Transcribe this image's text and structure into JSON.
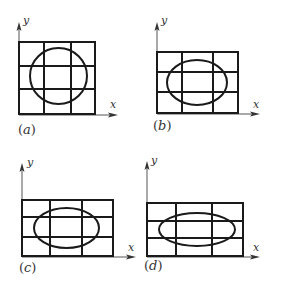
{
  "colors": {
    "ink": "#1a1a1a",
    "axis": "#555555",
    "background": "#ffffff"
  },
  "panels": [
    {
      "id": "a",
      "label": "(a)",
      "label_letter": "a",
      "axis_x_label": "x",
      "axis_y_label": "y",
      "shape": "circle",
      "grid": {
        "left": 19,
        "top": 42,
        "right": 95,
        "bottom": 114,
        "v": [
          44,
          71
        ],
        "h": [
          66,
          89
        ]
      },
      "ellipse": {
        "cx": 58.5,
        "cy": 76,
        "rx": 28.5,
        "ry": 28
      },
      "y_axis": {
        "x": 19,
        "top": 24
      },
      "x_axis": {
        "y": 115,
        "right": 117
      }
    },
    {
      "id": "b",
      "label": "(b)",
      "label_letter": "b",
      "axis_x_label": "x",
      "axis_y_label": "y",
      "shape": "ellipse",
      "grid": {
        "left": 157,
        "top": 52,
        "right": 238,
        "bottom": 113,
        "v": [
          182,
          213
        ],
        "h": [
          72,
          92
        ]
      },
      "ellipse": {
        "cx": 197,
        "cy": 82.5,
        "rx": 30,
        "ry": 22.5
      },
      "y_axis": {
        "x": 157,
        "top": 24
      },
      "x_axis": {
        "y": 114,
        "right": 259
      }
    },
    {
      "id": "c",
      "label": "(c)",
      "label_letter": "c",
      "axis_x_label": "x",
      "axis_y_label": "y",
      "shape": "ellipse",
      "grid": {
        "left": 22,
        "top": 200,
        "right": 113,
        "bottom": 256,
        "v": [
          50,
          82
        ],
        "h": [
          217,
          237
        ]
      },
      "ellipse": {
        "cx": 66.5,
        "cy": 228,
        "rx": 32.5,
        "ry": 20
      },
      "y_axis": {
        "x": 22,
        "top": 165
      },
      "x_axis": {
        "y": 257,
        "right": 135
      }
    },
    {
      "id": "d",
      "label": "(d)",
      "label_letter": "d",
      "axis_x_label": "x",
      "axis_y_label": "y",
      "shape": "ellipse",
      "grid": {
        "left": 147,
        "top": 203,
        "right": 243,
        "bottom": 256,
        "v": [
          176,
          212
        ],
        "h": [
          221,
          238
        ]
      },
      "ellipse": {
        "cx": 197,
        "cy": 229.5,
        "rx": 38,
        "ry": 16.5
      },
      "y_axis": {
        "x": 147,
        "top": 163
      },
      "x_axis": {
        "y": 257,
        "right": 259
      }
    }
  ]
}
